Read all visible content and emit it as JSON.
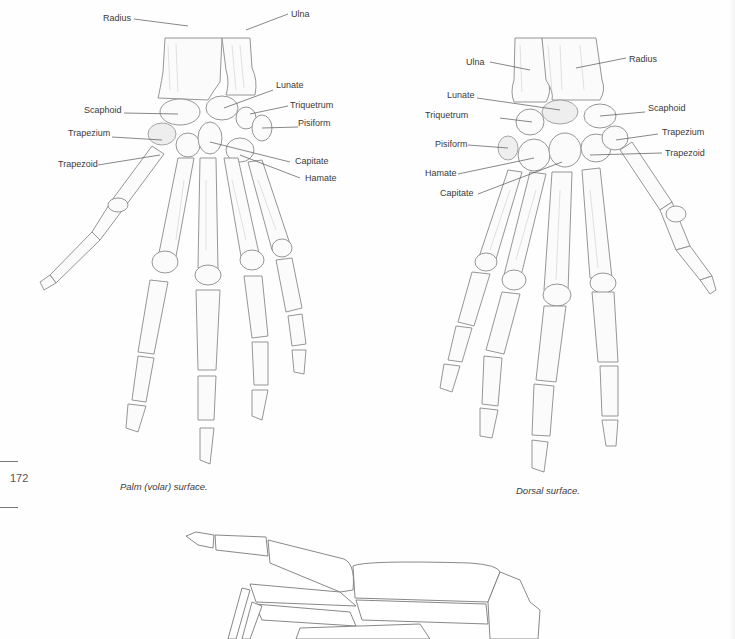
{
  "page": {
    "page_number": "172",
    "right_edge_labels": [
      "d",
      "ezium",
      "pezoid"
    ]
  },
  "palm_view": {
    "caption": "Palm (volar) surface.",
    "labels": {
      "radius": "Radius",
      "ulna": "Ulna",
      "lunate": "Lunate",
      "scaphoid": "Scaphoid",
      "triquetrum": "Triquetrum",
      "pisiform": "Pisiform",
      "trapezium": "Trapezium",
      "trapezoid": "Trapezoid",
      "capitate": "Capitate",
      "hamate": "Hamate"
    }
  },
  "dorsal_view": {
    "caption": "Dorsal surface.",
    "labels": {
      "ulna": "Ulna",
      "radius": "Radius",
      "lunate": "Lunate",
      "scaphoid": "Scaphoid",
      "triquetrum": "Triquetrum",
      "trapezium": "Trapezium",
      "pisiform": "Pisiform",
      "trapezoid": "Trapezoid",
      "hamate": "Hamate",
      "capitate": "Capitate"
    }
  },
  "side_view": {
    "description": "Lateral view of hand skeleton (partially visible)"
  },
  "colors": {
    "paper": "#fefefe",
    "ink": "#3a3a3a",
    "bone_line": "#8a8a8a"
  }
}
